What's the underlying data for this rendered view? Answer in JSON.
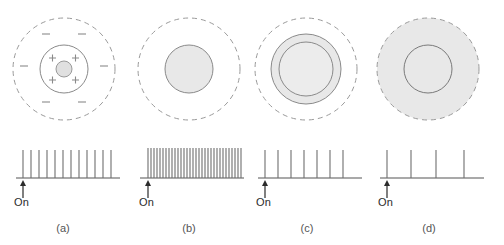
{
  "figure": {
    "type": "receptive-field-response-diagram",
    "stroke_color": "#808080",
    "fill_color": "#e6e6e6",
    "spike_color": "#6e6e6e",
    "axis_color": "#555555",
    "text_color": "#2b2b2b"
  },
  "panels": [
    {
      "id": "a",
      "label": "(a)",
      "onset_label": "On",
      "stimulus": {
        "name": "small-spot-center",
        "surround_sign": "-",
        "center_sign": "+",
        "plus_count": 4,
        "minus_count": 6,
        "spot_filled": true
      },
      "response": {
        "spike_count": 12,
        "rate_description": "moderate sustained firing"
      }
    },
    {
      "id": "b",
      "label": "(b)",
      "onset_label": "On",
      "stimulus": {
        "name": "center-spot-full",
        "spot_filled": true,
        "plus_count": 0,
        "minus_count": 0
      },
      "response": {
        "spike_count": 32,
        "rate_description": "vigorous high-frequency burst"
      }
    },
    {
      "id": "c",
      "label": "(c)",
      "onset_label": "On",
      "stimulus": {
        "name": "center-plus-partial-surround",
        "spot_filled": true,
        "ring_filled": true,
        "plus_count": 0,
        "minus_count": 0
      },
      "response": {
        "spike_count": 7,
        "rate_description": "reduced firing"
      }
    },
    {
      "id": "d",
      "label": "(d)",
      "onset_label": "On",
      "stimulus": {
        "name": "diffuse-full-field",
        "spot_filled": false,
        "field_filled": true,
        "plus_count": 0,
        "minus_count": 0
      },
      "response": {
        "spike_count": 4,
        "rate_description": "weak firing"
      }
    }
  ]
}
